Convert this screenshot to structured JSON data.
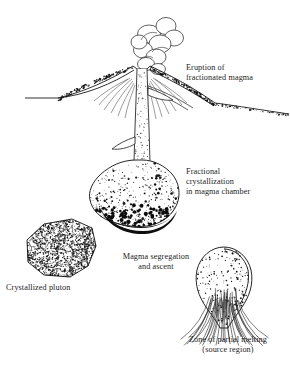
{
  "figure": {
    "kind": "geology-cross-section",
    "title_present": false,
    "background_color": "#ffffff",
    "ink_color": "#1a1a1a",
    "width": 290,
    "height": 368
  },
  "labels": {
    "eruption": "Eruption of\nfractionated magma",
    "fractional": "Fractional\ncrystallization\nin magma chamber",
    "segregation": "Magma segregation\nand ascent",
    "pluton": "Crystallized pluton",
    "zone": "Zone of partial melting\n(source region)"
  },
  "elements": [
    {
      "name": "eruption-cloud",
      "description": "billowing ash plume of overlapping lobes above vent"
    },
    {
      "name": "volcano-cone",
      "description": "stippled stratovolcano cone with layered flanks"
    },
    {
      "name": "ground-surface",
      "description": "horizontal land surface line"
    },
    {
      "name": "volcanic-conduit",
      "description": "stippled vertical pipe feeding the vent with side dikes"
    },
    {
      "name": "magma-chamber",
      "description": "bulbous stippled chamber with dark cumulate floor"
    },
    {
      "name": "cumulate-layer",
      "description": "solid black crystal accumulation at chamber base"
    },
    {
      "name": "crystallized-pluton",
      "description": "irregular granitic body with crystal texture"
    },
    {
      "name": "partial-melt-zone",
      "description": "teardrop stippled source region with rising melt streaks"
    }
  ]
}
